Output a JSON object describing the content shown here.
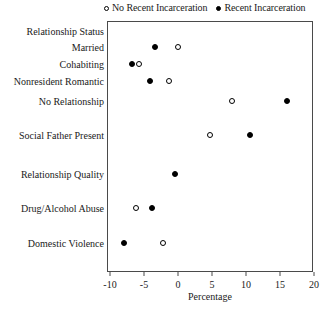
{
  "chart_data": {
    "type": "scatter",
    "title": "",
    "xlabel": "Percentage",
    "ylabel": "",
    "xlim": [
      -10.4,
      20
    ],
    "xticks": [
      -10,
      -5,
      0,
      5,
      10,
      15,
      20
    ],
    "xticklabels": [
      "-10",
      "-5",
      "0",
      "5",
      "10",
      "15",
      "20"
    ],
    "grid": false,
    "legend_position": "top",
    "legend": [
      {
        "name": "No Recent Incarceration",
        "marker": "open-circle"
      },
      {
        "name": "Recent Incarceration",
        "marker": "filled-circle"
      }
    ],
    "categories": [
      "Relationship Status",
      "Married",
      "Cohabiting",
      "Nonresident Romantic",
      "No Relationship",
      "Social Father Present",
      "Relationship Quality",
      "Drug/Alcohol Abuse",
      "Domestic Violence"
    ],
    "series": [
      {
        "name": "No Recent Incarceration",
        "marker": "open-circle",
        "values": [
          null,
          0.0,
          -5.7,
          -1.3,
          7.9,
          4.7,
          -0.4,
          -6.2,
          -2.2
        ]
      },
      {
        "name": "Recent Incarceration",
        "marker": "filled-circle",
        "values": [
          null,
          -3.4,
          -6.8,
          -4.1,
          16.0,
          10.6,
          -0.4,
          -3.8,
          -8.0
        ]
      }
    ],
    "points": [
      {
        "category": "Married",
        "series": "Recent Incarceration",
        "value": -3.4,
        "marker": "filled-circle"
      },
      {
        "category": "Married",
        "series": "No Recent Incarceration",
        "value": 0.0,
        "marker": "open-circle"
      },
      {
        "category": "Cohabiting",
        "series": "Recent Incarceration",
        "value": -6.8,
        "marker": "filled-circle"
      },
      {
        "category": "Cohabiting",
        "series": "No Recent Incarceration",
        "value": -5.7,
        "marker": "open-circle"
      },
      {
        "category": "Nonresident Romantic",
        "series": "Recent Incarceration",
        "value": -4.1,
        "marker": "filled-circle"
      },
      {
        "category": "Nonresident Romantic",
        "series": "No Recent Incarceration",
        "value": -1.3,
        "marker": "open-circle"
      },
      {
        "category": "No Relationship",
        "series": "No Recent Incarceration",
        "value": 7.9,
        "marker": "open-circle"
      },
      {
        "category": "No Relationship",
        "series": "Recent Incarceration",
        "value": 16.0,
        "marker": "filled-circle"
      },
      {
        "category": "Social Father Present",
        "series": "No Recent Incarceration",
        "value": 4.7,
        "marker": "open-circle"
      },
      {
        "category": "Social Father Present",
        "series": "Recent Incarceration",
        "value": 10.6,
        "marker": "filled-circle"
      },
      {
        "category": "Relationship Quality",
        "series": "Recent Incarceration",
        "value": -0.4,
        "marker": "filled-circle"
      },
      {
        "category": "Drug/Alcohol Abuse",
        "series": "No Recent Incarceration",
        "value": -6.2,
        "marker": "open-circle"
      },
      {
        "category": "Drug/Alcohol Abuse",
        "series": "Recent Incarceration",
        "value": -3.8,
        "marker": "filled-circle"
      },
      {
        "category": "Domestic Violence",
        "series": "Recent Incarceration",
        "value": -8.0,
        "marker": "filled-circle"
      },
      {
        "category": "Domestic Violence",
        "series": "No Recent Incarceration",
        "value": -2.2,
        "marker": "open-circle"
      }
    ]
  },
  "layout": {
    "plot_left": 107,
    "plot_top": 21,
    "plot_width": 206,
    "plot_height": 251,
    "px_per_unit": 6.8,
    "x_zero_px": 178,
    "row_y": {
      "Relationship Status": 31,
      "Married": 47,
      "Cohabiting": 64,
      "Nonresident Romantic": 81,
      "No Relationship": 101,
      "Social Father Present": 135,
      "Relationship Quality": 174,
      "Drug/Alcohol Abuse": 208,
      "Domestic Violence": 243
    }
  },
  "colors": {
    "marker": "#000000",
    "frame": "#4a4a4a",
    "text": "#1a1a1a",
    "background": "#ffffff"
  }
}
